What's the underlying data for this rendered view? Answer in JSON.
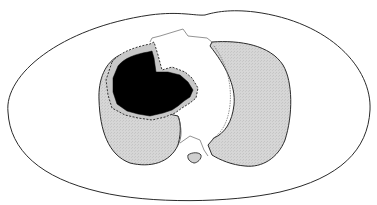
{
  "diagram": {
    "type": "axial-thoracic-cross-section",
    "width": 377,
    "height": 205,
    "colors": {
      "background": "#ffffff",
      "outline": "#2a2a2a",
      "lung_fill": "#d4d4d4",
      "mass_fill": "#000000",
      "mediastinum_line": "#6a6a6a"
    },
    "structures": [
      {
        "id": "body-outline",
        "label": "Body wall outline"
      },
      {
        "id": "right-lung",
        "label": "Lung (image left) with mass"
      },
      {
        "id": "mass",
        "label": "Dark lesion / mass"
      },
      {
        "id": "left-lung",
        "label": "Lung (image right)"
      },
      {
        "id": "mediastinum",
        "label": "Mediastinal outline"
      },
      {
        "id": "vertebra",
        "label": "Small vertebral body"
      }
    ]
  }
}
